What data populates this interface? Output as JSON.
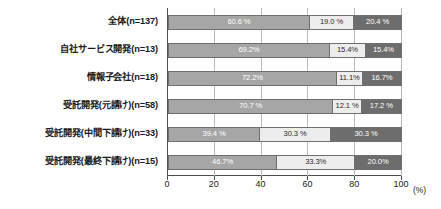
{
  "chart_data": {
    "type": "bar",
    "orientation": "horizontal",
    "stacked": true,
    "stack_total": 100,
    "title": "",
    "xlabel": "(%)",
    "ylabel": "",
    "xlim": [
      0,
      100
    ],
    "xticks": [
      "0",
      "20",
      "40",
      "60",
      "80",
      "100"
    ],
    "xtick_values": [
      0,
      20,
      40,
      60,
      80,
      100
    ],
    "grid": true,
    "grid_axis": "x",
    "legend": "none",
    "categories": [
      "全体(n=137)",
      "自社サービス開発(n=13)",
      "情報子会社(n=18)",
      "受託開発(元請け)(n=58)",
      "受託開発(中間下請け)(n=33)",
      "受託開発(最終下請け)(n=15)"
    ],
    "series": [
      {
        "name": "segment-1",
        "color": "#a6a6a6",
        "values": [
          60.6,
          69.2,
          72.2,
          70.7,
          39.4,
          46.7
        ],
        "labels": [
          "60.6 %",
          "69.2%",
          "72.2%",
          "70.7 %",
          "39.4 %",
          "46.7%"
        ]
      },
      {
        "name": "segment-2",
        "color": "#ededed",
        "values": [
          19.0,
          15.4,
          11.1,
          12.1,
          30.3,
          33.3
        ],
        "labels": [
          "19.0 %",
          "15.4%",
          "11.1%",
          "12.1 %",
          "30.3 %",
          "33.3%"
        ]
      },
      {
        "name": "segment-3",
        "color": "#6d6d6d",
        "values": [
          20.4,
          15.4,
          16.7,
          17.2,
          30.3,
          20.0
        ],
        "labels": [
          "20.4 %",
          "15.4%",
          "16.7%",
          "17.2 %",
          "30.3 %",
          "20.0%"
        ]
      }
    ]
  }
}
